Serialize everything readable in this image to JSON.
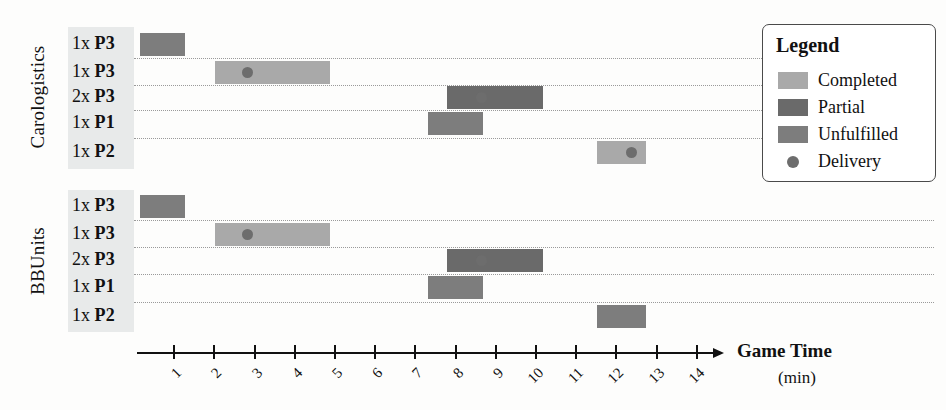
{
  "chart_data": {
    "type": "bar",
    "chart_kind": "gantt",
    "title": "",
    "xlabel": "Game Time",
    "xunit": "(min)",
    "ylabel": "",
    "xlim": [
      0,
      14.6
    ],
    "xticks": [
      1,
      2,
      3,
      4,
      5,
      6,
      7,
      8,
      9,
      10,
      11,
      12,
      13,
      14
    ],
    "grid": "horizontal-dotted",
    "legend_position": "top-right",
    "status_colors": {
      "completed": "#a9a9a9",
      "partial": "#6a6a6a",
      "unfulfilled": "#7d7d7d",
      "delivery": "#6d6d6d"
    },
    "groups": [
      {
        "name": "Carologistics",
        "rows": [
          {
            "label_qty": "1x",
            "label_product": "P3",
            "start": 0.18,
            "end": 1.3,
            "status": "unfulfilled",
            "delivery": null
          },
          {
            "label_qty": "1x",
            "label_product": "P3",
            "start": 2.05,
            "end": 4.9,
            "status": "completed",
            "delivery": 2.85
          },
          {
            "label_qty": "2x",
            "label_product": "P3",
            "start": 7.8,
            "end": 10.2,
            "status": "partial",
            "delivery": 8.68
          },
          {
            "label_qty": "1x",
            "label_product": "P1",
            "start": 7.33,
            "end": 8.7,
            "status": "unfulfilled",
            "delivery": null
          },
          {
            "label_qty": "1x",
            "label_product": "P2",
            "start": 11.55,
            "end": 12.75,
            "status": "completed",
            "delivery": 12.4
          }
        ]
      },
      {
        "name": "BBUnits",
        "rows": [
          {
            "label_qty": "1x",
            "label_product": "P3",
            "start": 0.18,
            "end": 1.3,
            "status": "unfulfilled",
            "delivery": null
          },
          {
            "label_qty": "1x",
            "label_product": "P3",
            "start": 2.05,
            "end": 4.9,
            "status": "completed",
            "delivery": 2.85
          },
          {
            "label_qty": "2x",
            "label_product": "P3",
            "start": 7.8,
            "end": 10.2,
            "status": "partial",
            "delivery": 8.68
          },
          {
            "label_qty": "1x",
            "label_product": "P1",
            "start": 7.33,
            "end": 8.7,
            "status": "unfulfilled",
            "delivery": null
          },
          {
            "label_qty": "1x",
            "label_product": "P2",
            "start": 11.55,
            "end": 12.75,
            "status": "unfulfilled",
            "delivery": null
          }
        ]
      }
    ]
  },
  "legend": {
    "title": "Legend",
    "items": [
      {
        "label": "Completed",
        "kind": "swatch",
        "color": "#a9a9a9"
      },
      {
        "label": "Partial",
        "kind": "swatch",
        "color": "#6a6a6a"
      },
      {
        "label": "Unfulfilled",
        "kind": "swatch",
        "color": "#7d7d7d"
      },
      {
        "label": "Delivery",
        "kind": "dot",
        "color": "#6d6d6d"
      }
    ]
  }
}
